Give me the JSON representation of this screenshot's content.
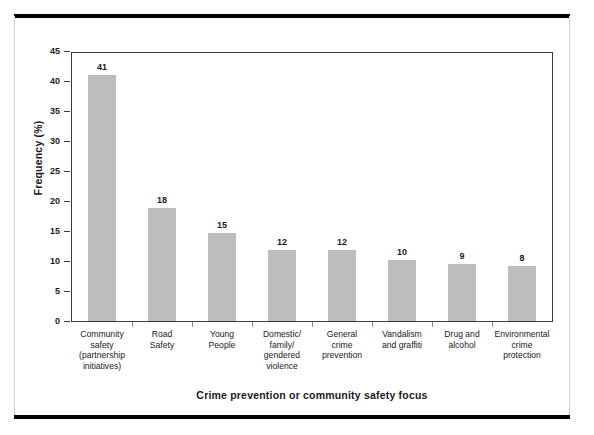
{
  "chart_data": {
    "type": "bar",
    "title": "",
    "xlabel": "Crime prevention or community safety focus",
    "ylabel": "Frequency (%)",
    "ylim": [
      0,
      45
    ],
    "ytick_labels": [
      "0",
      "5",
      "10",
      "15",
      "20",
      "25",
      "30",
      "35",
      "40",
      "45"
    ],
    "ytick_values": [
      0,
      5,
      10,
      15,
      20,
      25,
      30,
      35,
      40,
      45
    ],
    "grid": false,
    "legend": "none",
    "bar_color": "#bdbdbd",
    "categories": [
      "Community safety (partnership initiatives)",
      "Road Safety",
      "Young People",
      "Domestic/ family/ gendered violence",
      "General crime prevention",
      "Vandalism and graffiti",
      "Drug and alcohol",
      "Environmental crime protection"
    ],
    "category_lines": [
      [
        "Community",
        "safety",
        "(partnership",
        "initiatives)"
      ],
      [
        "Road",
        "Safety"
      ],
      [
        "Young",
        "People"
      ],
      [
        "Domestic/",
        "family/",
        "gendered",
        "violence"
      ],
      [
        "General",
        "crime",
        "prevention"
      ],
      [
        "Vandalism",
        "and graffiti"
      ],
      [
        "Drug and",
        "alcohol"
      ],
      [
        "Environmental",
        "crime",
        "protection"
      ]
    ],
    "values": [
      41,
      18,
      15,
      12,
      12,
      10,
      9,
      8
    ],
    "value_labels": [
      "41",
      "18",
      "15",
      "12",
      "12",
      "10",
      "9",
      "8"
    ],
    "bar_heights_plotted": [
      41.3,
      19.0,
      14.8,
      12.0,
      12.0,
      10.2,
      9.6,
      9.2
    ]
  }
}
